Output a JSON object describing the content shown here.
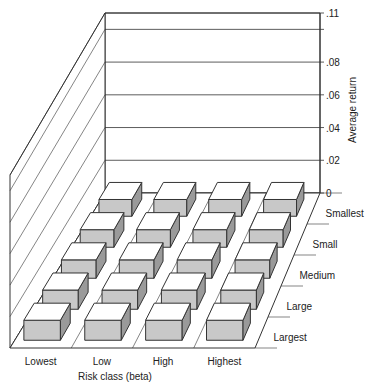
{
  "chart_data": {
    "type": "bar",
    "subtype": "3d-bar-grid",
    "title": "",
    "xlabel": "Risk class (beta)",
    "ylabel": "Size class",
    "zlabel": "Average return",
    "categories": [
      "Lowest",
      "Low",
      "High",
      "Highest"
    ],
    "depth_categories": [
      "Smallest",
      "Small",
      "Medium",
      "Large",
      "Largest"
    ],
    "zlim": [
      0,
      0.11
    ],
    "z_ticks": [
      {
        "value": 0,
        "label": "0"
      },
      {
        "value": 0.02,
        "label": ".02"
      },
      {
        "value": 0.04,
        "label": ".04"
      },
      {
        "value": 0.06,
        "label": ".06"
      },
      {
        "value": 0.08,
        "label": ".08"
      },
      {
        "value": 0.1,
        "label": ""
      },
      {
        "value": 0.11,
        "label": ".11"
      }
    ],
    "series": [
      {
        "name": "Smallest",
        "values": [
          0.01,
          0.01,
          0.01,
          0.01
        ]
      },
      {
        "name": "Small",
        "values": [
          0.01,
          0.01,
          0.01,
          0.01
        ]
      },
      {
        "name": "Medium",
        "values": [
          0.01,
          0.01,
          0.01,
          0.01
        ]
      },
      {
        "name": "Large",
        "values": [
          0.01,
          0.01,
          0.01,
          0.01
        ]
      },
      {
        "name": "Largest",
        "values": [
          0.01,
          0.01,
          0.01,
          0.01
        ]
      }
    ],
    "grid": true,
    "legend": "none"
  },
  "colors": {
    "bar_top": "#ffffff",
    "bar_front": "#c8c8c8",
    "bar_side": "#9a9a9a",
    "line": "#333333"
  }
}
